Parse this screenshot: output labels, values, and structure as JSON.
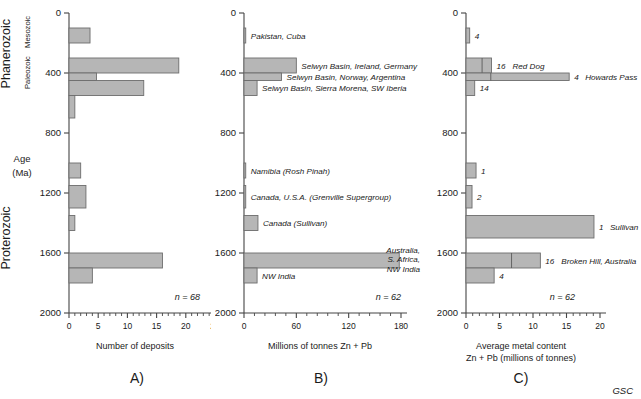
{
  "figure": {
    "credit": "GSC",
    "age_axis": {
      "label_line1": "Age",
      "label_line2": "(Ma)",
      "ticks": [
        0,
        400,
        800,
        1200,
        1600,
        2000
      ],
      "min": 0,
      "max": 2000
    },
    "eras": [
      {
        "name": "Phanerozoic",
        "from": 0,
        "to": 542
      },
      {
        "name": "Proterozoic",
        "from": 1000,
        "to": 2000
      }
    ],
    "sub_eras": [
      {
        "name": "Mesozoic",
        "from": 0,
        "to": 252
      },
      {
        "name": "Paleozoic",
        "from": 252,
        "to": 542
      }
    ],
    "bar_color": "#b6b6b6",
    "bar_stroke": "#6d6d6d"
  },
  "chart_data": [
    {
      "type": "bar",
      "orientation": "horizontal",
      "panel": "A)",
      "title": "",
      "xlabel": "Number of deposits",
      "ylabel": "Age (Ma)",
      "xlim": [
        0,
        25
      ],
      "ylim": [
        2000,
        0
      ],
      "xticks": [
        0,
        5,
        10,
        15,
        20,
        25
      ],
      "yticks": [
        0,
        400,
        800,
        1200,
        1600,
        2000
      ],
      "grid": false,
      "n_label": "n = 68",
      "n": 68,
      "bins": [
        {
          "age_top": 100,
          "age_bottom": 200,
          "value": 3.6
        },
        {
          "age_top": 300,
          "age_bottom": 400,
          "value": 18.8
        },
        {
          "age_top": 400,
          "age_bottom": 450,
          "value": 4.7
        },
        {
          "age_top": 450,
          "age_bottom": 550,
          "value": 12.8
        },
        {
          "age_top": 550,
          "age_bottom": 700,
          "value": 1.0
        },
        {
          "age_top": 1000,
          "age_bottom": 1100,
          "value": 2.0
        },
        {
          "age_top": 1150,
          "age_bottom": 1300,
          "value": 2.9
        },
        {
          "age_top": 1350,
          "age_bottom": 1450,
          "value": 1.0
        },
        {
          "age_top": 1600,
          "age_bottom": 1700,
          "value": 16.0
        },
        {
          "age_top": 1700,
          "age_bottom": 1800,
          "value": 4.0
        }
      ]
    },
    {
      "type": "bar",
      "orientation": "horizontal",
      "panel": "B)",
      "title": "",
      "xlabel": "Millions of tonnes Zn + Pb",
      "ylabel": "Age (Ma)",
      "xlim": [
        0,
        180
      ],
      "ylim": [
        2000,
        0
      ],
      "xticks": [
        0,
        60,
        120,
        180
      ],
      "yticks": [
        0,
        400,
        800,
        1200,
        1600,
        2000
      ],
      "grid": false,
      "n_label": "n = 62",
      "n": 62,
      "bins": [
        {
          "age_top": 100,
          "age_bottom": 200,
          "value": 2.0,
          "annotation": "Pakistan, Cuba"
        },
        {
          "age_top": 300,
          "age_bottom": 400,
          "value": 60.0,
          "annotation": "Selwyn Basin, Ireland, Germany"
        },
        {
          "age_top": 400,
          "age_bottom": 450,
          "value": 43.0,
          "annotation": "Selwyn Basin, Norway, Argentina"
        },
        {
          "age_top": 450,
          "age_bottom": 550,
          "value": 15.0,
          "annotation": "Selwyn Basin, Sierra Morena, SW Iberia"
        },
        {
          "age_top": 1000,
          "age_bottom": 1100,
          "value": 2.0,
          "annotation": "Namibia (Rosh Pinah)"
        },
        {
          "age_top": 1150,
          "age_bottom": 1300,
          "value": 2.0,
          "annotation": "Canada, U.S.A. (Grenville Supergroup)"
        },
        {
          "age_top": 1350,
          "age_bottom": 1450,
          "value": 16.0,
          "annotation": "Canada (Sullivan)"
        },
        {
          "age_top": 1600,
          "age_bottom": 1700,
          "value": 178.0,
          "annotation": "Australia, S. Africa, NW India",
          "annotation_lines": [
            "Australia,",
            "S. Africa,",
            "NW India"
          ],
          "annotation_side": "right"
        },
        {
          "age_top": 1700,
          "age_bottom": 1800,
          "value": 15.0,
          "annotation": "NW India"
        }
      ]
    },
    {
      "type": "bar",
      "orientation": "horizontal",
      "panel": "C)",
      "title": "",
      "xlabel_line1": "Average metal content",
      "xlabel_line2": "Zn + Pb (millions of tonnes)",
      "ylabel": "Age (Ma)",
      "xlim": [
        0,
        20
      ],
      "ylim": [
        2000,
        0
      ],
      "xticks": [
        0,
        5,
        10,
        15,
        20
      ],
      "yticks": [
        0,
        400,
        800,
        1200,
        1600,
        2000
      ],
      "grid": false,
      "n_label": "n = 62",
      "n": 62,
      "bins": [
        {
          "age_top": 100,
          "age_bottom": 200,
          "value": 0.55,
          "count": "4"
        },
        {
          "age_top": 300,
          "age_bottom": 400,
          "value": 3.8,
          "divider": 2.4,
          "count": "16",
          "annotation": "Red Dog"
        },
        {
          "age_top": 400,
          "age_bottom": 450,
          "value": 15.4,
          "divider": 3.7,
          "count": "4",
          "annotation": "Howards Pass"
        },
        {
          "age_top": 450,
          "age_bottom": 550,
          "value": 1.3,
          "count": "14"
        },
        {
          "age_top": 1000,
          "age_bottom": 1100,
          "value": 1.5,
          "count": "1"
        },
        {
          "age_top": 1150,
          "age_bottom": 1300,
          "value": 0.9,
          "count": "2"
        },
        {
          "age_top": 1350,
          "age_bottom": 1500,
          "value": 19.1,
          "count": "1",
          "annotation": "Sullivan"
        },
        {
          "age_top": 1600,
          "age_bottom": 1700,
          "value": 11.1,
          "divider": 6.8,
          "count": "16",
          "annotation": "Broken Hill, Australia"
        },
        {
          "age_top": 1700,
          "age_bottom": 1800,
          "value": 4.2,
          "count": "4"
        }
      ]
    }
  ]
}
